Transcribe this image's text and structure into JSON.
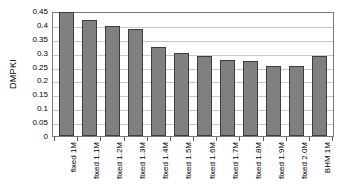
{
  "chart_data": {
    "type": "bar",
    "title": "",
    "xlabel": "",
    "ylabel": "DMPKI",
    "ylim": [
      0,
      0.45
    ],
    "grid": true,
    "legend": "none",
    "y_ticks": [
      0,
      0.05,
      0.1,
      0.15,
      0.2,
      0.25,
      0.3,
      0.35,
      0.4,
      0.45
    ],
    "y_tick_labels": [
      "0",
      "0.05",
      "0.1",
      "0.15",
      "0.2",
      "0.25",
      "0.3",
      "0.35",
      "0.4",
      "0.45"
    ],
    "categories": [
      "fixed 1M",
      "fixed 1.1M",
      "fixed 1.2M",
      "fixed 1.3M",
      "fixed 1.4M",
      "fixed 1.5M",
      "fixed 1.6M",
      "fixed 1.7M",
      "fixed 1.8M",
      "fixed 1.9M",
      "fixed 2.0M",
      "BHM 1M"
    ],
    "values": [
      0.448,
      0.418,
      0.397,
      0.385,
      0.321,
      0.298,
      0.287,
      0.275,
      0.27,
      0.252,
      0.253,
      0.287
    ],
    "bar_color": "#808080",
    "bar_border_color": "#3d3d3d",
    "gridline_color": "#c8c8c8",
    "axis_color": "#7a7a7a"
  }
}
